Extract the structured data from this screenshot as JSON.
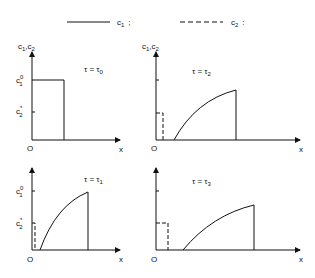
{
  "legend": {
    "c1_label": "c",
    "c1_sub": "1",
    "c1_sep": ";",
    "c2_label": "c",
    "c2_sub": "2",
    "c2_sep": ":"
  },
  "axes": {
    "y_label": "c",
    "y_label_sub1": "1",
    "y_label_mid": ",c",
    "y_label_sub2": "2",
    "origin": "O",
    "x_label": "x",
    "c1_tick": "c",
    "c1_tick_sup": "0",
    "c1_tick_sub": "1",
    "c2_tick": "c",
    "c2_tick_sup": "*",
    "c2_tick_sub": "2"
  },
  "panels": [
    {
      "id": "tau0",
      "title_prefix": "τ = τ",
      "title_sub": "0"
    },
    {
      "id": "tau2",
      "title_prefix": "τ = τ",
      "title_sub": "2"
    },
    {
      "id": "tau1",
      "title_prefix": "τ = τ",
      "title_sub": "1"
    },
    {
      "id": "tau3",
      "title_prefix": "τ = τ",
      "title_sub": "3"
    }
  ]
}
